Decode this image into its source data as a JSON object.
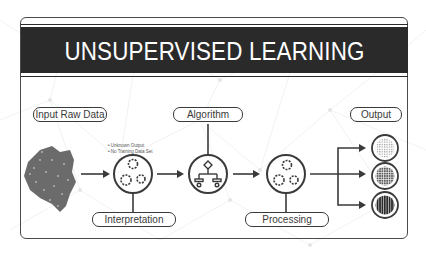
{
  "title": "UNSUPERVISED LEARNING",
  "labels": {
    "input": "Input Raw Data",
    "algorithm": "Algorithm",
    "output": "Output",
    "interpretation": "Interpretation",
    "processing": "Processing"
  },
  "notes": [
    "• Unknown Output",
    "• No Training Data Set"
  ],
  "stages": [
    {
      "id": "raw-data",
      "icon": "data-cluster-icon"
    },
    {
      "id": "interpretation",
      "icon": "gears-icon"
    },
    {
      "id": "algorithm",
      "icon": "flowchart-icon"
    },
    {
      "id": "processing",
      "icon": "gears-icon"
    },
    {
      "id": "outputs",
      "icon": "grid-circle-icon",
      "count": 3
    }
  ],
  "colors": {
    "ink": "#3a3a3a",
    "band": "#2a2a2a",
    "background": "#ffffff"
  }
}
